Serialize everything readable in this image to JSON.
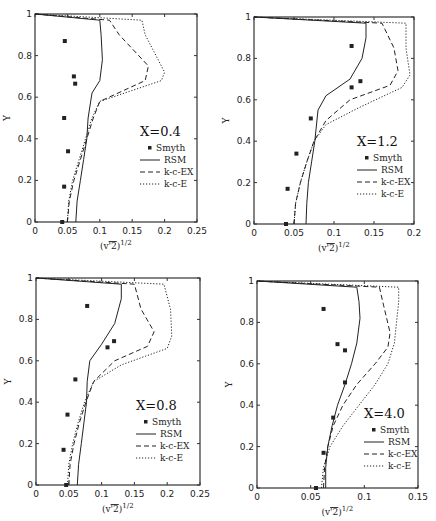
{
  "chart_data": [
    {
      "type": "line",
      "title": "X=0.4",
      "xlabel": "(v'^2)^1/2",
      "ylabel": "Y",
      "xlim": [
        0,
        0.25
      ],
      "ylim": [
        0,
        1
      ],
      "xticks": [
        "0",
        "0.05",
        "0.1",
        "0.15",
        "0.2",
        "0.25"
      ],
      "yticks": [
        "0",
        "0.2",
        "0.4",
        "0.6",
        "0.8",
        "1"
      ],
      "legend": [
        "Smyth",
        "RSM",
        "k-c-EX",
        "k-c-E"
      ],
      "frame": {
        "x0": 35,
        "x1": 197,
        "yTop": 14,
        "yBot": 222
      },
      "legend_pos": {
        "x": 140,
        "y": 136
      },
      "series": [
        {
          "name": "Smyth",
          "style": "marker",
          "x": [
            0.042,
            0.045,
            0.051,
            0.045,
            0.062,
            0.06,
            0.046
          ],
          "y": [
            0.0,
            0.17,
            0.34,
            0.5,
            0.665,
            0.7,
            0.87
          ]
        },
        {
          "name": "RSM",
          "style": "solid",
          "x": [
            0.063,
            0.065,
            0.07,
            0.075,
            0.08,
            0.082,
            0.088,
            0.1,
            0.104,
            0.102,
            0.1,
            0.0
          ],
          "y": [
            0.0,
            0.1,
            0.2,
            0.3,
            0.4,
            0.5,
            0.62,
            0.68,
            0.78,
            0.9,
            0.97,
            1.0
          ]
        },
        {
          "name": "k-c-EX",
          "style": "dashed",
          "x": [
            0.05,
            0.053,
            0.06,
            0.07,
            0.08,
            0.09,
            0.1,
            0.17,
            0.175,
            0.13,
            0.115,
            0.0
          ],
          "y": [
            0.0,
            0.1,
            0.2,
            0.3,
            0.4,
            0.5,
            0.58,
            0.68,
            0.75,
            0.9,
            0.97,
            1.0
          ]
        },
        {
          "name": "k-c-E",
          "style": "dotted",
          "x": [
            0.05,
            0.052,
            0.058,
            0.068,
            0.078,
            0.088,
            0.1,
            0.195,
            0.2,
            0.17,
            0.165,
            0.0
          ],
          "y": [
            0.0,
            0.1,
            0.2,
            0.3,
            0.4,
            0.5,
            0.58,
            0.68,
            0.72,
            0.9,
            0.97,
            1.0
          ]
        }
      ]
    },
    {
      "type": "line",
      "title": "X=1.2",
      "xlabel": "(v'^2)^1/2",
      "ylabel": "Y",
      "xlim": [
        0,
        0.2
      ],
      "ylim": [
        0,
        1
      ],
      "xticks": [
        "0",
        "0.05",
        "0.1",
        "0.15",
        "0.2"
      ],
      "yticks": [
        "0",
        "0.2",
        "0.4",
        "0.6",
        "0.8",
        "1"
      ],
      "legend": [
        "Smyth",
        "RSM",
        "k-c-EX",
        "k-c-E"
      ],
      "frame": {
        "x0": 254,
        "x1": 414,
        "yTop": 17,
        "yBot": 224
      },
      "legend_pos": {
        "x": 357,
        "y": 146
      },
      "series": [
        {
          "name": "Smyth",
          "style": "marker",
          "x": [
            0.04,
            0.042,
            0.053,
            0.071,
            0.122,
            0.133,
            0.122
          ],
          "y": [
            0.0,
            0.17,
            0.34,
            0.51,
            0.66,
            0.69,
            0.86
          ]
        },
        {
          "name": "RSM",
          "style": "solid",
          "x": [
            0.065,
            0.066,
            0.068,
            0.072,
            0.076,
            0.08,
            0.09,
            0.12,
            0.135,
            0.14,
            0.14,
            0.0
          ],
          "y": [
            0.0,
            0.1,
            0.2,
            0.3,
            0.4,
            0.55,
            0.62,
            0.7,
            0.8,
            0.9,
            0.97,
            1.0
          ]
        },
        {
          "name": "k-c-EX",
          "style": "dashed",
          "x": [
            0.05,
            0.052,
            0.058,
            0.066,
            0.075,
            0.09,
            0.12,
            0.17,
            0.18,
            0.175,
            0.16,
            0.0
          ],
          "y": [
            0.0,
            0.1,
            0.2,
            0.3,
            0.4,
            0.5,
            0.6,
            0.67,
            0.74,
            0.85,
            0.97,
            1.0
          ]
        },
        {
          "name": "k-c-E",
          "style": "dotted",
          "x": [
            0.05,
            0.052,
            0.058,
            0.066,
            0.075,
            0.09,
            0.13,
            0.185,
            0.195,
            0.19,
            0.19,
            0.0
          ],
          "y": [
            0.0,
            0.1,
            0.2,
            0.3,
            0.4,
            0.48,
            0.56,
            0.66,
            0.72,
            0.85,
            0.97,
            1.0
          ]
        }
      ]
    },
    {
      "type": "line",
      "title": "X=0.8",
      "xlabel": "(v'^2)^1/2",
      "ylabel": "Y",
      "xlim": [
        0,
        0.25
      ],
      "ylim": [
        0,
        1
      ],
      "xticks": [
        "0",
        "0.05",
        "0.1",
        "0.15",
        "0.2",
        "0.25"
      ],
      "yticks": [
        "0",
        "0.2",
        "0.4",
        "0.6",
        "0.8",
        "1"
      ],
      "legend": [
        "Smyth",
        "RSM",
        "k-c-EX",
        "k-c-E"
      ],
      "frame": {
        "x0": 36,
        "x1": 200,
        "yTop": 278,
        "yBot": 485
      },
      "legend_pos": {
        "x": 136,
        "y": 410
      },
      "series": [
        {
          "name": "Smyth",
          "style": "marker",
          "x": [
            0.046,
            0.042,
            0.048,
            0.06,
            0.109,
            0.119,
            0.078
          ],
          "y": [
            0.0,
            0.17,
            0.34,
            0.51,
            0.665,
            0.695,
            0.865
          ]
        },
        {
          "name": "RSM",
          "style": "solid",
          "x": [
            0.063,
            0.065,
            0.069,
            0.073,
            0.077,
            0.078,
            0.082,
            0.1,
            0.12,
            0.13,
            0.13,
            0.0
          ],
          "y": [
            0.0,
            0.1,
            0.2,
            0.3,
            0.4,
            0.5,
            0.6,
            0.68,
            0.78,
            0.9,
            0.97,
            1.0
          ]
        },
        {
          "name": "k-c-EX",
          "style": "dashed",
          "x": [
            0.05,
            0.052,
            0.058,
            0.066,
            0.076,
            0.088,
            0.12,
            0.17,
            0.18,
            0.16,
            0.15,
            0.0
          ],
          "y": [
            0.0,
            0.1,
            0.2,
            0.3,
            0.4,
            0.5,
            0.6,
            0.67,
            0.74,
            0.85,
            0.97,
            1.0
          ]
        },
        {
          "name": "k-c-E",
          "style": "dotted",
          "x": [
            0.048,
            0.05,
            0.056,
            0.064,
            0.074,
            0.088,
            0.13,
            0.2,
            0.207,
            0.205,
            0.195,
            0.0
          ],
          "y": [
            0.0,
            0.1,
            0.2,
            0.3,
            0.4,
            0.5,
            0.58,
            0.66,
            0.72,
            0.85,
            0.97,
            1.0
          ]
        }
      ]
    },
    {
      "type": "line",
      "title": "X=4.0",
      "xlabel": "(v'^2)^1/2",
      "ylabel": "Y",
      "xlim": [
        0,
        0.15
      ],
      "ylim": [
        0,
        1
      ],
      "xticks": [
        "0",
        "0.05",
        "0.1",
        "0.15"
      ],
      "yticks": [
        "0",
        "0.2",
        "0.4",
        "0.6",
        "0.8",
        "1"
      ],
      "legend": [
        "Smyth",
        "RSM",
        "k-c-EX",
        "k-c-E"
      ],
      "frame": {
        "x0": 257,
        "x1": 418,
        "yTop": 281,
        "yBot": 488
      },
      "legend_pos": {
        "x": 364,
        "y": 418
      },
      "series": [
        {
          "name": "Smyth",
          "style": "marker",
          "x": [
            0.055,
            0.062,
            0.071,
            0.082,
            0.082,
            0.075,
            0.062
          ],
          "y": [
            0.0,
            0.17,
            0.34,
            0.51,
            0.665,
            0.695,
            0.865
          ]
        },
        {
          "name": "RSM",
          "style": "solid",
          "x": [
            0.064,
            0.064,
            0.066,
            0.07,
            0.075,
            0.082,
            0.088,
            0.093,
            0.096,
            0.095,
            0.093,
            0.0
          ],
          "y": [
            0.0,
            0.1,
            0.2,
            0.3,
            0.4,
            0.5,
            0.6,
            0.7,
            0.82,
            0.9,
            0.97,
            1.0
          ]
        },
        {
          "name": "k-c-EX",
          "style": "dashed",
          "x": [
            0.062,
            0.063,
            0.066,
            0.071,
            0.08,
            0.093,
            0.11,
            0.122,
            0.124,
            0.118,
            0.114,
            0.0
          ],
          "y": [
            0.0,
            0.1,
            0.2,
            0.3,
            0.4,
            0.5,
            0.6,
            0.68,
            0.75,
            0.88,
            0.97,
            1.0
          ]
        },
        {
          "name": "k-c-E",
          "style": "dotted",
          "x": [
            0.06,
            0.062,
            0.068,
            0.08,
            0.095,
            0.11,
            0.122,
            0.128,
            0.13,
            0.132,
            0.132,
            0.0
          ],
          "y": [
            0.0,
            0.1,
            0.2,
            0.3,
            0.4,
            0.5,
            0.6,
            0.7,
            0.8,
            0.9,
            0.97,
            1.0
          ]
        }
      ]
    }
  ]
}
